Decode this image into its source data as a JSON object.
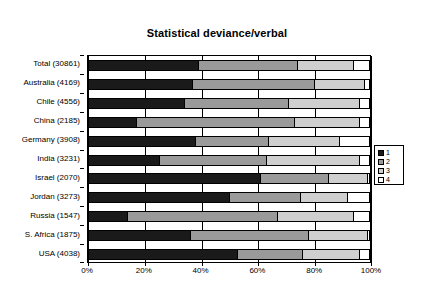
{
  "chart_data": {
    "type": "bar",
    "subtype": "horizontal-100-percent-stacked",
    "title": "Statistical deviance/verbal",
    "xlabel": "",
    "ylabel": "",
    "xlim": [
      0,
      100
    ],
    "xticks": [
      "0%",
      "20%",
      "40%",
      "60%",
      "80%",
      "100%"
    ],
    "xtick_values": [
      0,
      20,
      40,
      60,
      80,
      100
    ],
    "grid": true,
    "legend_position": "right",
    "legend": [
      "1",
      "2",
      "3",
      "4"
    ],
    "series_colors": [
      "#1a1a1a",
      "#9a9a9a",
      "#cfcfcf",
      "#ffffff"
    ],
    "categories": [
      "Total (30861)",
      "Australia (4169)",
      "Chile (4556)",
      "China (2185)",
      "Germany (3908)",
      "India (3231)",
      "Israel (2070)",
      "Jordan (3273)",
      "Russia (1547)",
      "S. Africa (1875)",
      "USA (4038)"
    ],
    "series": [
      {
        "name": "1",
        "values": [
          39,
          37,
          34,
          17,
          38,
          25,
          61,
          50,
          14,
          36,
          53
        ]
      },
      {
        "name": "2",
        "values": [
          35,
          43,
          37,
          56,
          26,
          38,
          24,
          25,
          53,
          42,
          23
        ]
      },
      {
        "name": "3",
        "values": [
          20,
          18,
          25,
          23,
          25,
          33,
          14,
          17,
          27,
          21,
          20
        ]
      },
      {
        "name": "4",
        "values": [
          6,
          2,
          4,
          4,
          11,
          4,
          1,
          8,
          6,
          1,
          4
        ]
      }
    ],
    "rows": [
      {
        "label": "Total (30861)",
        "n": 30861,
        "values": [
          39,
          35,
          20,
          6
        ]
      },
      {
        "label": "Australia (4169)",
        "n": 4169,
        "values": [
          37,
          43,
          18,
          2
        ]
      },
      {
        "label": "Chile (4556)",
        "n": 4556,
        "values": [
          34,
          37,
          25,
          4
        ]
      },
      {
        "label": "China (2185)",
        "n": 2185,
        "values": [
          17,
          56,
          23,
          4
        ]
      },
      {
        "label": "Germany (3908)",
        "n": 3908,
        "values": [
          38,
          26,
          25,
          11
        ]
      },
      {
        "label": "India (3231)",
        "n": 3231,
        "values": [
          25,
          38,
          33,
          4
        ]
      },
      {
        "label": "Israel (2070)",
        "n": 2070,
        "values": [
          61,
          24,
          14,
          1
        ]
      },
      {
        "label": "Jordan (3273)",
        "n": 3273,
        "values": [
          50,
          25,
          17,
          8
        ]
      },
      {
        "label": "Russia (1547)",
        "n": 1547,
        "values": [
          14,
          53,
          27,
          6
        ]
      },
      {
        "label": "S. Africa (1875)",
        "n": 1875,
        "values": [
          36,
          42,
          21,
          1
        ]
      },
      {
        "label": "USA (4038)",
        "n": 4038,
        "values": [
          53,
          23,
          20,
          4
        ]
      }
    ]
  }
}
